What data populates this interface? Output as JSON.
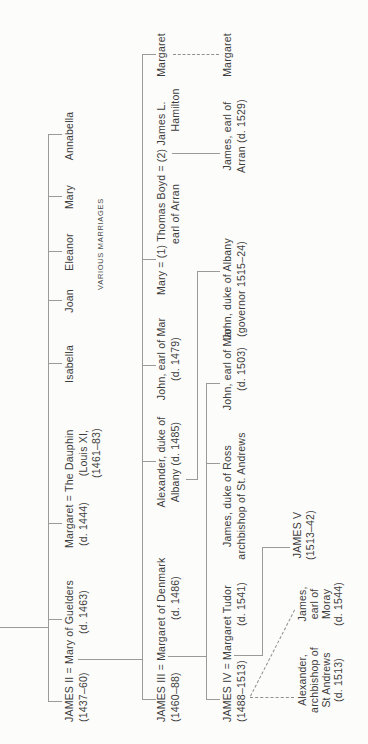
{
  "page": {
    "background_color": "#fcfcfb",
    "line_color": "#9a9a9a",
    "text_color": "#3c3c3c"
  },
  "tree": {
    "generation1": {
      "couple": "JAMES II = Mary of Guelders",
      "james_ii_dates": "(1437–60)",
      "mary_of_guelders_dates": "(d. 1463)",
      "margaret_couple": "Margaret = The Dauphin",
      "margaret_dates": "(d. 1444)",
      "dauphin_line2": "(Louis XI,",
      "dauphin_line3": "(1461–83)",
      "daughters": [
        "Isabella",
        "Joan",
        "Eleanor",
        "Mary",
        "Annabella"
      ],
      "daughters_note": "VARIOUS MARRIAGES"
    },
    "generation2": {
      "couple": "JAMES III = Margaret of Denmark",
      "james_iii_dates": "(1460–88)",
      "margaret_of_denmark_dates": "(d. 1486)",
      "alexander_line1": "Alexander, duke of",
      "alexander_line2": "Albany (d. 1485)",
      "john_mar_line1": "John, earl of Mar",
      "john_mar_dates": "(d. 1479)",
      "mary_marriages": "Mary = (1) Thomas Boyd = (2) James L.",
      "thomas_boyd_line2": "earl of Arran",
      "hamilton_line2": "Hamilton",
      "margaret": "Margaret"
    },
    "generation3": {
      "couple": "JAMES IV = Margaret Tudor",
      "james_iv_dates": "(1488–1513)",
      "margaret_tudor_dates": "(d. 1541)",
      "james_ross_line1": "James, duke of Ross",
      "james_ross_line2": "archbishop of St. Andrews",
      "john_mar_line1": "John, earl of Mar",
      "john_mar_dates": "(d. 1503)",
      "john_albany_line1": "John, duke of Albany",
      "john_albany_line2": "(governor 1515–24)",
      "james_arran_line1": "James, earl of",
      "james_arran_line2": "Arran (d. 1529)",
      "margaret": "Margaret"
    },
    "generation4": {
      "james_v": "JAMES V",
      "james_v_dates": "(1513–42)",
      "alexander_lines": [
        "Alexander,",
        "archbishop of",
        "St Andrews",
        "(d. 1513)"
      ],
      "james_moray_lines": [
        "James,",
        "earl of",
        "Moray",
        "(d. 1544)"
      ]
    }
  }
}
